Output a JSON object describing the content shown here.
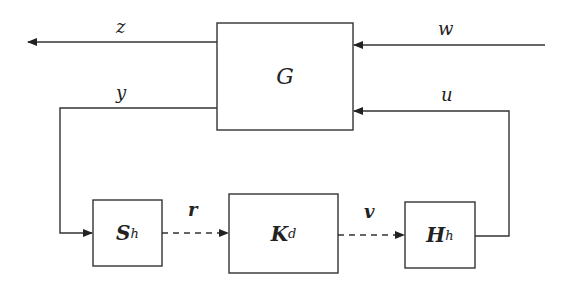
{
  "blocks": {
    "plant": {
      "label": "G"
    },
    "sampler": {
      "label": "S",
      "sub": "h"
    },
    "controller": {
      "label": "K",
      "sub": "d"
    },
    "hold": {
      "label": "H",
      "sub": "h"
    }
  },
  "signals": {
    "z": "z",
    "w": "w",
    "y": "y",
    "u": "u",
    "r": "r",
    "v": "v"
  }
}
